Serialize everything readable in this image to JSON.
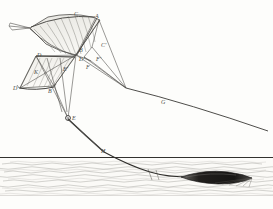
{
  "figure": {
    "kind": "engraving-line-diagram",
    "background_color": "#fdfdfb",
    "ink_color": "#4a4a46",
    "accent_color": "#1d1d1b"
  },
  "labels": [
    {
      "id": "C",
      "text": "C",
      "x": 74,
      "y": 11
    },
    {
      "id": "A",
      "text": "A",
      "x": 95,
      "y": 13
    },
    {
      "id": "Cp",
      "text": "C'",
      "x": 101,
      "y": 42
    },
    {
      "id": "B",
      "text": "B",
      "x": 79,
      "y": 47
    },
    {
      "id": "Dp",
      "text": "D'",
      "x": 79,
      "y": 56
    },
    {
      "id": "D",
      "text": "D",
      "x": 37,
      "y": 52
    },
    {
      "id": "Fp",
      "text": "F'",
      "x": 96,
      "y": 56
    },
    {
      "id": "F",
      "text": "F",
      "x": 86,
      "y": 64
    },
    {
      "id": "Ep",
      "text": "E'",
      "x": 63,
      "y": 66
    },
    {
      "id": "K",
      "text": "K",
      "x": 34,
      "y": 69
    },
    {
      "id": "Dl",
      "text": "D",
      "x": 13,
      "y": 85
    },
    {
      "id": "Bl",
      "text": "B",
      "x": 48,
      "y": 88
    },
    {
      "id": "E",
      "text": "E",
      "x": 72,
      "y": 115
    },
    {
      "id": "G",
      "text": "G",
      "x": 161,
      "y": 99
    },
    {
      "id": "H",
      "text": "H",
      "x": 101,
      "y": 148
    }
  ],
  "scene": {
    "horizon_y": 157,
    "water_top": 160,
    "water_bottom": 196,
    "boat": {
      "x": 205,
      "y": 178,
      "length": 48,
      "label": "boat"
    },
    "tether_label": "G",
    "anchor_label": "H"
  },
  "waves": {
    "rows": 7,
    "description": "hatched wave lines"
  }
}
